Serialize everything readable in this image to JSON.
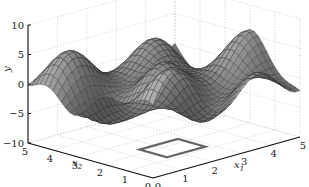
{
  "chart_data": {
    "type": "surface3d",
    "title": "",
    "xlabel": "x1",
    "ylabel": "x2",
    "zlabel": "y",
    "x1_ticks": [
      "0",
      "1",
      "2",
      "3",
      "4",
      "5"
    ],
    "x2_ticks": [
      "0",
      "1",
      "2",
      "3",
      "4",
      "5"
    ],
    "y_ticks": [
      "-10",
      "-5",
      "0",
      "5",
      "10"
    ],
    "x1_range": [
      0,
      5
    ],
    "x2_range": [
      0,
      5
    ],
    "y_range": [
      -10,
      10
    ],
    "grid": true,
    "surface": {
      "description": "oscillatory multimodal surface (mesh, grayscale) with peaks up to ~9 and troughs to ~-5",
      "approx_peaks": [
        {
          "x1": 1.0,
          "x2": 4.0,
          "y": 5
        },
        {
          "x1": 2.0,
          "x2": 3.0,
          "y": 8
        },
        {
          "x1": 3.0,
          "x2": 2.0,
          "y": 9
        },
        {
          "x1": 4.0,
          "x2": 1.5,
          "y": 9
        }
      ],
      "approx_min": -5,
      "colormap": "gray"
    },
    "floor_marker": {
      "shape": "square outline",
      "x1_range": [
        1.5,
        2.8
      ],
      "x2_range": [
        1.2,
        2.3
      ],
      "color": "#666666"
    }
  },
  "labels": {
    "y": "y",
    "x1": "x",
    "x1_sub": "1",
    "x2": "x",
    "x2_sub": "2"
  }
}
